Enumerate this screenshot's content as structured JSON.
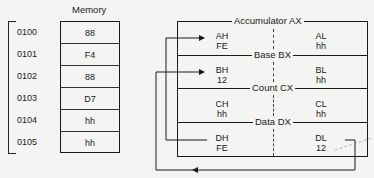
{
  "memory": {
    "title": "Memory",
    "rows": [
      {
        "address": "0100",
        "value": "88"
      },
      {
        "address": "0101",
        "value": "F4"
      },
      {
        "address": "0102",
        "value": "88"
      },
      {
        "address": "0103",
        "value": "D7"
      },
      {
        "address": "0104",
        "value": "hh"
      },
      {
        "address": "0105",
        "value": "hh"
      }
    ]
  },
  "registers": [
    {
      "name": "Accumulator AX",
      "high": {
        "label": "AH",
        "value": "FE"
      },
      "low": {
        "label": "AL",
        "value": "hh"
      }
    },
    {
      "name": "Base BX",
      "high": {
        "label": "BH",
        "value": "12"
      },
      "low": {
        "label": "BL",
        "value": "hh"
      }
    },
    {
      "name": "Count CX",
      "high": {
        "label": "CH",
        "value": "hh"
      },
      "low": {
        "label": "CL",
        "value": "hh"
      }
    },
    {
      "name": "Data DX",
      "high": {
        "label": "DH",
        "value": "FE"
      },
      "low": {
        "label": "DL",
        "value": "12"
      }
    }
  ],
  "colors": {
    "ink": "#1a1a1a",
    "paper": "#f4f4f2"
  }
}
